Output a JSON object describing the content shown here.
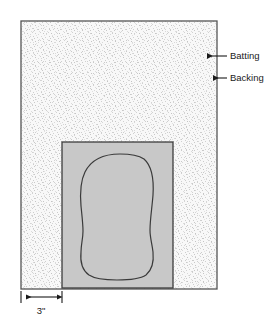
{
  "figure": {
    "kind": "quilting-layout-diagram",
    "title": "",
    "colors": {
      "batting_fill": "#f7f7f7",
      "batting_speckle": "#c9c9c9",
      "fabric_fill": "#c8c8c8",
      "outline": "#3d3d3d",
      "border": "#555555",
      "text": "#1a1a1a",
      "background": "#ffffff"
    }
  },
  "callouts": [
    {
      "id": "batting",
      "label": "Batting",
      "arrow": "arrow-left",
      "text_x": 230,
      "text_y": 56,
      "line_x1": 227,
      "line_x2": 207,
      "line_y": 56,
      "tip_x": 203
    },
    {
      "id": "backing",
      "label": "Backing",
      "arrow": "arrow-left",
      "text_x": 230,
      "text_y": 78,
      "line_x1": 227,
      "line_x2": 213,
      "line_y": 78,
      "tip_x": 209
    }
  ],
  "dimension": {
    "label": "3\"",
    "label_x": 41,
    "label_y": 311,
    "line_y": 297,
    "x_start": 21,
    "x_end": 62,
    "tick_top": 291,
    "tick_bottom": 303
  },
  "shapes": {
    "outer_rect": {
      "name": "batting-backing-panel",
      "x": 21,
      "y": 21,
      "width": 196,
      "height": 268
    },
    "inner_rect": {
      "name": "fabric-piece",
      "x": 62,
      "y": 142,
      "width": 111,
      "height": 146
    },
    "pattern_blob": {
      "name": "cozy-pattern-outline",
      "path": "M 120 154 C 104 154, 91 160, 85 172 C 80 182, 80 194, 81 206 C 82 216, 83 224, 83 231 C 83 239, 81 244, 81 252 C 80 262, 82 270, 89 275 C 95 279, 104 280, 117 280 C 130 280, 140 279, 146 275 C 152 270, 154 262, 153 252 C 152 243, 150 238, 150 230 C 150 220, 152 208, 153 195 C 154 179, 152 166, 144 159 C 138 155, 130 154, 120 154 Z"
    }
  }
}
